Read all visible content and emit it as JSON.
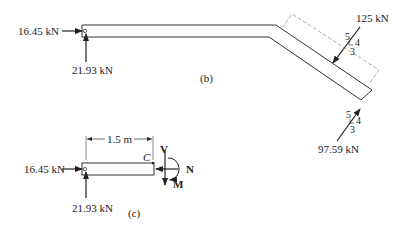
{
  "figure_b": {
    "caption": "(b)",
    "left_horizontal_force": "16.45 kN",
    "left_vertical_force": "21.93 kN",
    "top_incline_force": "125 kN",
    "top_incline_slope": {
      "hyp": "5",
      "rise": "4",
      "run": "3"
    },
    "bottom_incline_force": "97.59 kN",
    "bottom_incline_slope": {
      "hyp": "5",
      "rise": "4",
      "run": "3"
    }
  },
  "figure_c": {
    "caption": "(c)",
    "dimension": "1.5 m",
    "section_point": "C",
    "left_horizontal_force": "16.45 kN",
    "left_vertical_force": "21.93 kN",
    "shear_label": "V",
    "normal_label": "N",
    "moment_label": "M"
  },
  "colors": {
    "line": "#333333",
    "dashed": "#999999"
  }
}
